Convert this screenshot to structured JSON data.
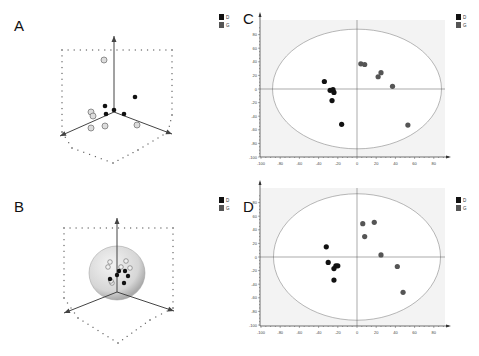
{
  "panels": {
    "A": {
      "letter": "A"
    },
    "B": {
      "letter": "B"
    },
    "C": {
      "letter": "C"
    },
    "D": {
      "letter": "D"
    }
  },
  "legend": [
    {
      "label": "D",
      "color": "#111111"
    },
    {
      "label": "G",
      "color": "#555555"
    }
  ],
  "chart_data": [
    {
      "panel": "A",
      "type": "scatter",
      "title": "",
      "projection": "3d",
      "axis_label": "t[2]/t[3]",
      "legend": [
        "D",
        "G"
      ],
      "series": [
        {
          "name": "D",
          "points_screen_order": 5
        },
        {
          "name": "G",
          "points_screen_order": 6
        }
      ]
    },
    {
      "panel": "B",
      "type": "scatter",
      "title": "",
      "projection": "3d",
      "confidence_sphere": true,
      "legend": [
        "D",
        "G"
      ],
      "series": [
        {
          "name": "D",
          "points_screen_order": 6
        },
        {
          "name": "G",
          "points_screen_order": 6
        }
      ]
    },
    {
      "panel": "C",
      "type": "scatter",
      "title": "",
      "xlabel": "",
      "ylabel": "",
      "xlim": [
        -100,
        95
      ],
      "ylim": [
        -100,
        95
      ],
      "xticks": [
        -100,
        -80,
        -60,
        -40,
        -20,
        0,
        20,
        40,
        60,
        80
      ],
      "yticks": [
        -100,
        -80,
        -60,
        -40,
        -20,
        0,
        20,
        40,
        60,
        80
      ],
      "ellipse": {
        "rx": 88,
        "ry": 88
      },
      "legend_position": "top-right",
      "series": [
        {
          "name": "D",
          "color": "#111111",
          "x": [
            -34,
            -28,
            -25,
            -24,
            -26,
            -16
          ],
          "y": [
            11,
            -2,
            -1,
            -5,
            -17,
            -52
          ]
        },
        {
          "name": "G",
          "color": "#555555",
          "x": [
            4,
            8,
            22,
            25,
            37,
            53
          ],
          "y": [
            37,
            36,
            18,
            24,
            4,
            -53
          ]
        }
      ]
    },
    {
      "panel": "D",
      "type": "scatter",
      "title": "",
      "xlabel": "",
      "ylabel": "",
      "xlim": [
        -100,
        95
      ],
      "ylim": [
        -100,
        95
      ],
      "xticks": [
        -100,
        -80,
        -60,
        -40,
        -20,
        0,
        20,
        40,
        60,
        80
      ],
      "yticks": [
        -100,
        -80,
        -60,
        -40,
        -20,
        0,
        20,
        40,
        60,
        80
      ],
      "ellipse": {
        "rx": 87,
        "ry": 93
      },
      "legend_position": "top-right",
      "series": [
        {
          "name": "D",
          "color": "#111111",
          "x": [
            -32,
            -30,
            -24,
            -22,
            -20,
            -24
          ],
          "y": [
            15,
            -8,
            -17,
            -13,
            -13,
            -34
          ]
        },
        {
          "name": "G",
          "color": "#555555",
          "x": [
            6,
            18,
            8,
            25,
            42,
            48
          ],
          "y": [
            49,
            51,
            30,
            3,
            -14,
            -52
          ]
        }
      ]
    }
  ]
}
